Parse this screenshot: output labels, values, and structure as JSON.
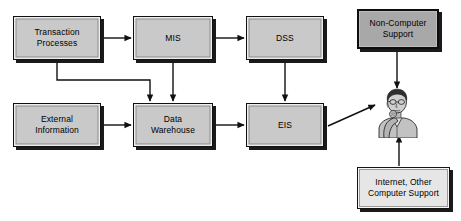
{
  "diagram": {
    "background_color": "#ffffff",
    "line_color": "#111111",
    "box_fill_standard": "#c9c9c9",
    "box_fill_dark": "#a8a8a8",
    "box_fill_light": "#e6e6e6",
    "box_border_color": "#111111",
    "shadow_color": "#1a1a1a"
  },
  "nodes": [
    {
      "id": "transaction_processes",
      "label": "Transaction\nProcesses",
      "style": "standard",
      "x": 13,
      "y": 16,
      "w": 88,
      "h": 44
    },
    {
      "id": "mis",
      "label": "MIS",
      "style": "standard",
      "x": 133,
      "y": 16,
      "w": 80,
      "h": 44
    },
    {
      "id": "dss",
      "label": "DSS",
      "style": "standard",
      "x": 246,
      "y": 16,
      "w": 78,
      "h": 44
    },
    {
      "id": "non_computer_support",
      "label": "Non-Computer\nSupport",
      "style": "dark",
      "x": 357,
      "y": 9,
      "w": 82,
      "h": 40
    },
    {
      "id": "external_information",
      "label": "External\nInformation",
      "style": "standard",
      "x": 13,
      "y": 103,
      "w": 88,
      "h": 44
    },
    {
      "id": "data_warehouse",
      "label": "Data\nWarehouse",
      "style": "standard",
      "x": 133,
      "y": 103,
      "w": 80,
      "h": 44
    },
    {
      "id": "eis",
      "label": "EIS",
      "style": "standard",
      "x": 246,
      "y": 103,
      "w": 78,
      "h": 44
    },
    {
      "id": "internet_other_support",
      "label": "Internet, Other\nComputer Support",
      "style": "light",
      "x": 357,
      "y": 167,
      "w": 93,
      "h": 42
    }
  ],
  "person": {
    "id": "executive-user",
    "label": "",
    "x": 374,
    "y": 88,
    "w": 46,
    "h": 50
  },
  "edges": [
    {
      "id": "transaction-to-mis",
      "from": "transaction_processes",
      "to": "mis",
      "kind": "straight-right"
    },
    {
      "id": "mis-to-dss",
      "from": "mis",
      "to": "dss",
      "kind": "straight-right"
    },
    {
      "id": "transaction-to-warehouse",
      "from": "transaction_processes",
      "to": "data_warehouse",
      "kind": "elbow-down-right"
    },
    {
      "id": "mis-to-warehouse",
      "from": "mis",
      "to": "data_warehouse",
      "kind": "straight-down"
    },
    {
      "id": "dss-to-eis",
      "from": "dss",
      "to": "eis",
      "kind": "straight-down"
    },
    {
      "id": "external-to-warehouse",
      "from": "external_information",
      "to": "data_warehouse",
      "kind": "straight-right"
    },
    {
      "id": "warehouse-to-eis",
      "from": "data_warehouse",
      "to": "eis",
      "kind": "straight-right"
    },
    {
      "id": "eis-to-person",
      "from": "eis",
      "to": "person",
      "kind": "diagonal-up-right"
    },
    {
      "id": "non-computer-support-to-person",
      "from": "non_computer_support",
      "to": "person",
      "kind": "straight-down"
    },
    {
      "id": "internet-support-to-person",
      "from": "internet_other_support",
      "to": "person",
      "kind": "straight-up"
    }
  ]
}
